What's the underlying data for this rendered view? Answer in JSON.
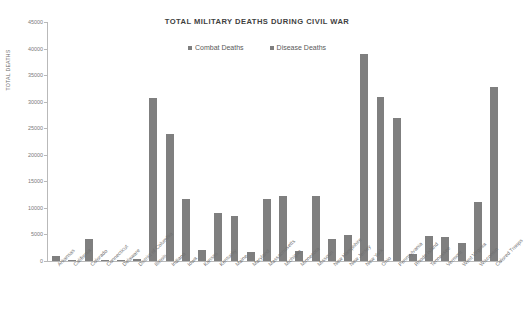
{
  "chart_data": {
    "type": "bar",
    "title": "TOTAL MILITARY DEATHS DURING CIVIL WAR",
    "xlabel": "",
    "ylabel": "TOTAL DEATHS",
    "ylim": [
      0,
      45000
    ],
    "ytick_step": 5000,
    "grid": false,
    "legend_position": "top-center",
    "bar_color": "#7f7f7f",
    "categories": [
      "Arkansas",
      "California",
      "Colorado",
      "Connecticut",
      "Delaware",
      "District of Columbia",
      "Illinois",
      "Indiana",
      "Iowa",
      "Kansas",
      "Kentucky",
      "Maine",
      "Maryland",
      "Massachusetts",
      "Michigan",
      "Minnesota",
      "Missouri",
      "New Hampshire",
      "New Jersey",
      "New York",
      "Ohio",
      "Pennsylvania",
      "Rhode Island",
      "Tennessee",
      "Vermont",
      "West Virginia",
      "Wisconsin",
      "Colored Troops"
    ],
    "series": [
      {
        "name": "Combat Deaths",
        "color": "#7f7f7f",
        "values": [
          1000,
          120,
          4200,
          140,
          160,
          300,
          30700,
          23900,
          11700,
          2000,
          9000,
          8400,
          1700,
          11700,
          12200,
          1800,
          12300,
          4200,
          4900,
          38900,
          30900,
          26900,
          1300,
          4800,
          4500,
          3300,
          11100,
          32800
        ]
      }
    ],
    "legend": [
      {
        "label": "Combat Deaths",
        "color": "#7f7f7f"
      },
      {
        "label": "Disease Deaths",
        "color": "#7f7f7f"
      }
    ],
    "ytick_labels": [
      "45000",
      "40000",
      "35000",
      "30000",
      "25000",
      "20000",
      "15000",
      "10000",
      "5000",
      "0"
    ]
  }
}
